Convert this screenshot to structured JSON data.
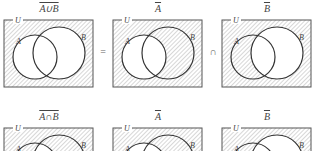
{
  "rows": [
    {
      "name": "de-morgan-union",
      "panels": [
        {
          "label": "A∪B",
          "shade": "complement-union",
          "universe": "U",
          "set_a": "A",
          "set_b": "B"
        },
        {
          "label": "A",
          "shade": "complement-a",
          "universe": "U",
          "set_a": "A",
          "set_b": "B"
        },
        {
          "label": "B",
          "shade": "complement-b",
          "universe": "U",
          "set_a": "A",
          "set_b": "B"
        }
      ],
      "operators": [
        "=",
        "∩"
      ]
    },
    {
      "name": "de-morgan-intersection",
      "panels": [
        {
          "label": "A∩B",
          "shade": "complement-intersection",
          "universe": "U",
          "set_a": "A",
          "set_b": "B"
        },
        {
          "label": "A",
          "shade": "complement-a",
          "universe": "U",
          "set_a": "A",
          "set_b": "B"
        },
        {
          "label": "B",
          "shade": "complement-b",
          "universe": "U",
          "set_a": "A",
          "set_b": "B"
        }
      ],
      "operators": [
        "=",
        "∪"
      ]
    }
  ],
  "colors": {
    "border": "#555555",
    "circle": "#333333",
    "hatch": "#9a9a9a",
    "background": "#ffffff"
  }
}
